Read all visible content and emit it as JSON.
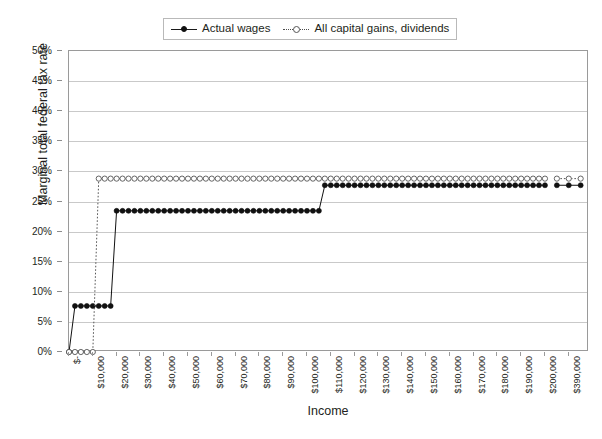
{
  "chart_data": {
    "type": "line",
    "title": "",
    "xlabel": "Income",
    "ylabel": "Marginal total federal tax rate",
    "xlim": [
      0,
      400000
    ],
    "ylim": [
      0,
      0.5
    ],
    "grid": true,
    "legend_position": "top-center",
    "y_tick_labels": [
      "0%",
      "5%",
      "10%",
      "15%",
      "20%",
      "25%",
      "30%",
      "35%",
      "40%",
      "45%",
      "50%"
    ],
    "y_tick_values": [
      0,
      5,
      10,
      15,
      20,
      25,
      30,
      35,
      40,
      45,
      50
    ],
    "x_tick_labels": [
      "$-",
      "$10,000",
      "$20,000",
      "$30,000",
      "$40,000",
      "$50,000",
      "$60,000",
      "$70,000",
      "$80,000",
      "$90,000",
      "$100,000",
      "$110,000",
      "$120,000",
      "$130,000",
      "$140,000",
      "$150,000",
      "$160,000",
      "$170,000",
      "$180,000",
      "$190,000",
      "$200,000",
      "$390,000"
    ],
    "x_tick_values": [
      0,
      10000,
      20000,
      30000,
      40000,
      50000,
      60000,
      70000,
      80000,
      90000,
      100000,
      110000,
      120000,
      130000,
      140000,
      150000,
      160000,
      170000,
      180000,
      190000,
      200000,
      390000
    ],
    "series": [
      {
        "name": "Actual wages",
        "style": "solid",
        "marker": "filled-circle",
        "color": "#111111",
        "x": [
          0,
          2500,
          5000,
          7500,
          10000,
          12500,
          15000,
          17500,
          20000,
          22500,
          25000,
          27500,
          30000,
          32500,
          35000,
          37500,
          40000,
          42500,
          45000,
          47500,
          50000,
          52500,
          55000,
          57500,
          60000,
          62500,
          65000,
          67500,
          70000,
          72500,
          75000,
          77500,
          80000,
          82500,
          85000,
          87500,
          90000,
          92500,
          95000,
          97500,
          100000,
          102500,
          105000,
          107500,
          110000,
          112500,
          115000,
          117500,
          120000,
          122500,
          125000,
          127500,
          130000,
          132500,
          135000,
          137500,
          140000,
          142500,
          145000,
          147500,
          150000,
          152500,
          155000,
          157500,
          160000,
          162500,
          165000,
          167500,
          170000,
          172500,
          175000,
          177500,
          180000,
          182500,
          185000,
          187500,
          190000,
          192500,
          195000,
          197500,
          200000,
          385000,
          390000,
          395000
        ],
        "y": [
          0,
          7.65,
          7.65,
          7.65,
          7.65,
          7.65,
          7.65,
          7.65,
          23.45,
          23.45,
          23.45,
          23.45,
          23.45,
          23.45,
          23.45,
          23.45,
          23.45,
          23.45,
          23.45,
          23.45,
          23.45,
          23.45,
          23.45,
          23.45,
          23.45,
          23.45,
          23.45,
          23.45,
          23.45,
          23.45,
          23.45,
          23.45,
          23.45,
          23.45,
          23.45,
          23.45,
          23.45,
          23.45,
          23.45,
          23.45,
          23.45,
          23.45,
          23.45,
          27.7,
          27.7,
          27.7,
          27.7,
          27.7,
          27.7,
          27.7,
          27.7,
          27.7,
          27.7,
          27.7,
          27.7,
          27.7,
          27.7,
          27.7,
          27.7,
          27.7,
          27.7,
          27.7,
          27.7,
          27.7,
          27.7,
          27.7,
          27.7,
          27.7,
          27.7,
          27.7,
          27.7,
          27.7,
          27.7,
          27.7,
          27.7,
          27.7,
          27.7,
          27.7,
          27.7,
          27.7,
          27.7,
          27.7,
          27.7,
          27.7
        ]
      },
      {
        "name": "All capital gains, dividends",
        "style": "dotted",
        "marker": "open-circle",
        "color": "#555555",
        "x": [
          0,
          2500,
          5000,
          7500,
          10000,
          12500,
          15000,
          17500,
          20000,
          22500,
          25000,
          27500,
          30000,
          32500,
          35000,
          37500,
          40000,
          42500,
          45000,
          47500,
          50000,
          52500,
          55000,
          57500,
          60000,
          62500,
          65000,
          67500,
          70000,
          72500,
          75000,
          77500,
          80000,
          82500,
          85000,
          87500,
          90000,
          92500,
          95000,
          97500,
          100000,
          102500,
          105000,
          107500,
          110000,
          112500,
          115000,
          117500,
          120000,
          122500,
          125000,
          127500,
          130000,
          132500,
          135000,
          137500,
          140000,
          142500,
          145000,
          147500,
          150000,
          152500,
          155000,
          157500,
          160000,
          162500,
          165000,
          167500,
          170000,
          172500,
          175000,
          177500,
          180000,
          182500,
          185000,
          187500,
          190000,
          192500,
          195000,
          197500,
          200000,
          385000,
          390000,
          395000
        ],
        "y": [
          0,
          0,
          0,
          0,
          0,
          28.8,
          28.8,
          28.8,
          28.8,
          28.8,
          28.8,
          28.8,
          28.8,
          28.8,
          28.8,
          28.8,
          28.8,
          28.8,
          28.8,
          28.8,
          28.8,
          28.8,
          28.8,
          28.8,
          28.8,
          28.8,
          28.8,
          28.8,
          28.8,
          28.8,
          28.8,
          28.8,
          28.8,
          28.8,
          28.8,
          28.8,
          28.8,
          28.8,
          28.8,
          28.8,
          28.8,
          28.8,
          28.8,
          28.8,
          28.8,
          28.8,
          28.8,
          28.8,
          28.8,
          28.8,
          28.8,
          28.8,
          28.8,
          28.8,
          28.8,
          28.8,
          28.8,
          28.8,
          28.8,
          28.8,
          28.8,
          28.8,
          28.8,
          28.8,
          28.8,
          28.8,
          28.8,
          28.8,
          28.8,
          28.8,
          28.8,
          28.8,
          28.8,
          28.8,
          28.8,
          28.8,
          28.8,
          28.8,
          28.8,
          28.8,
          28.8,
          28.8,
          28.8,
          28.8
        ]
      }
    ]
  },
  "legend": {
    "entries": [
      {
        "label": "Actual wages"
      },
      {
        "label": "All capital gains, dividends"
      }
    ]
  },
  "axes": {
    "y_title": "Marginal total federal tax rate",
    "x_title": "Income"
  }
}
